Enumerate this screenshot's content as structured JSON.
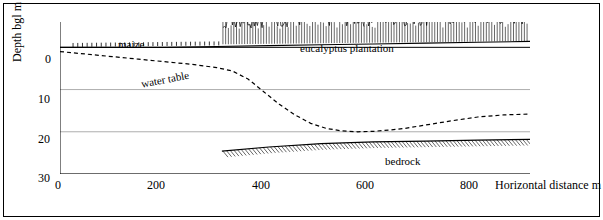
{
  "chart_data": {
    "type": "line",
    "title": "",
    "xlabel": "Horizontal distance  m",
    "ylabel": "Depth  bgl  m",
    "xlim": [
      0,
      900
    ],
    "ylim": [
      30,
      -6
    ],
    "xticks": [
      0,
      200,
      400,
      600,
      800
    ],
    "yticks": [
      0,
      10,
      20,
      30
    ],
    "grid": true,
    "annotations": [
      {
        "name": "maize",
        "text": "maize",
        "x": 130,
        "y": -3.2
      },
      {
        "name": "eucalyptus-plantation",
        "text": "eucalyptus plantation",
        "x": 420,
        "y": -2.2
      },
      {
        "name": "water-table",
        "text": "water table",
        "x": 190,
        "y": 5.6
      },
      {
        "name": "bedrock",
        "text": "bedrock",
        "x": 650,
        "y": 24.5
      }
    ],
    "series": [
      {
        "name": "ground surface",
        "style": "solid",
        "x": [
          0,
          100,
          200,
          300,
          400,
          500,
          600,
          700,
          800,
          900
        ],
        "y": [
          0.0,
          0.0,
          0.0,
          -0.2,
          -0.4,
          -0.6,
          -0.8,
          -1.0,
          -1.2,
          -1.4
        ]
      },
      {
        "name": "water table",
        "style": "dashed",
        "x": [
          0,
          50,
          100,
          150,
          200,
          250,
          300,
          330,
          360,
          390,
          420,
          450,
          480,
          510,
          540,
          570,
          600,
          630,
          660,
          700,
          750,
          800,
          850,
          900
        ],
        "y": [
          1.0,
          1.6,
          2.2,
          2.8,
          3.4,
          4.0,
          4.8,
          5.6,
          7.5,
          10.5,
          13.5,
          16.0,
          18.0,
          19.2,
          19.8,
          20.0,
          19.9,
          19.6,
          19.2,
          18.4,
          17.4,
          16.5,
          16.0,
          15.8
        ]
      },
      {
        "name": "bedrock",
        "style": "solid",
        "x": [
          310,
          400,
          500,
          600,
          700,
          800,
          900
        ],
        "y": [
          24.6,
          23.6,
          22.8,
          22.4,
          22.2,
          22.0,
          21.8
        ]
      }
    ]
  },
  "axes": {
    "x_tick_labels": [
      "0",
      "200",
      "400",
      "600",
      "800"
    ],
    "y_tick_labels": [
      "0",
      "10",
      "20",
      "30"
    ],
    "x_axis_title": "Horizontal distance  m",
    "y_axis_title": "Depth  bgl  m"
  },
  "colors": {
    "line": "#000000",
    "grid": "#808080",
    "background": "#ffffff",
    "border": "#000000"
  }
}
